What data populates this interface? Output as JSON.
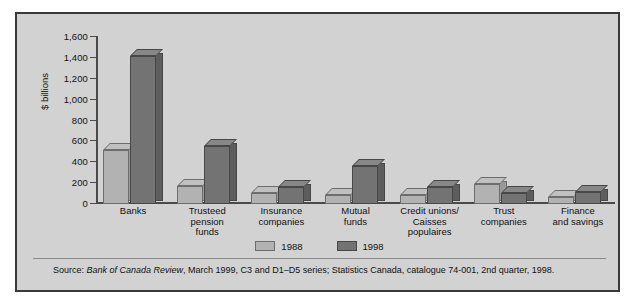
{
  "chart_data": {
    "type": "bar",
    "title": "",
    "xlabel": "",
    "ylabel": "$ billions",
    "ylim": [
      0,
      1600
    ],
    "yticks": [
      0,
      200,
      400,
      600,
      800,
      1000,
      1200,
      1400,
      1600
    ],
    "ytick_labels": [
      "0",
      "200",
      "400",
      "600",
      "800",
      "1,000",
      "1,200",
      "1,400",
      "1,600"
    ],
    "grid": false,
    "legend_position": "bottom-center",
    "categories": [
      "Banks",
      "Trusteed\npension\nfunds",
      "Insurance\ncompanies",
      "Mutual\nfunds",
      "Credit unions/\nCaisses\npopulaires",
      "Trust\ncompanies",
      "Finance\nand savings"
    ],
    "series": [
      {
        "name": "1988",
        "color": "#b2b2b2",
        "values": [
          520,
          175,
          105,
          85,
          90,
          190,
          65
        ]
      },
      {
        "name": "1998",
        "color": "#737373",
        "values": [
          1420,
          560,
          165,
          360,
          160,
          110,
          115
        ]
      }
    ]
  },
  "legend": [
    {
      "label": "1988",
      "color": "#b2b2b2"
    },
    {
      "label": "1998",
      "color": "#737373"
    }
  ],
  "source": {
    "prefix": "Source: ",
    "italic": "Bank of Canada Review",
    "rest": ", March 1999, C3 and D1–D5 series; Statistics Canada, catalogue 74-001, 2nd quarter, 1998."
  }
}
